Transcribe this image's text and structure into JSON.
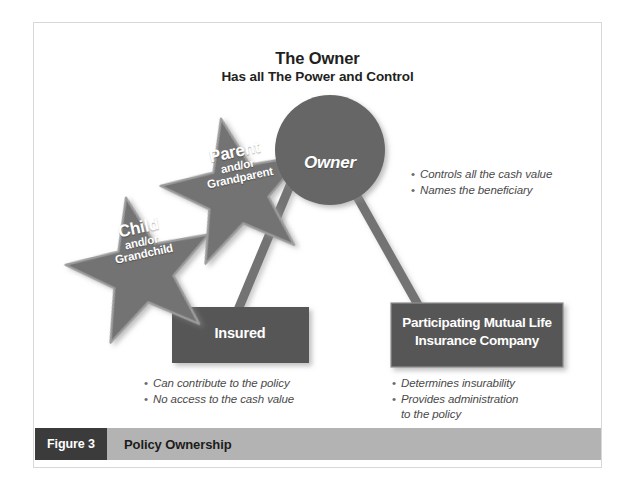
{
  "figure": {
    "title_line_1": "The Owner",
    "title_line_2": "Has all The Power and Control",
    "caption_number": "Figure 3",
    "caption_title": "Policy Ownership"
  },
  "nodes": {
    "owner": {
      "shape": "circle",
      "label": "Owner",
      "color": "#666666"
    },
    "parent_star": {
      "shape": "star",
      "line_1": "Parent",
      "line_2": "and/or",
      "line_3": "Grandparent",
      "color": "#737373"
    },
    "child_star": {
      "shape": "star",
      "line_1": "Child",
      "line_2": "and/or",
      "line_3": "Grandchild",
      "color": "#737373"
    },
    "insured_box": {
      "shape": "rectangle",
      "label": "Insured",
      "color": "#575757"
    },
    "company_box": {
      "shape": "rectangle",
      "line_1": "Participating Mutual Life",
      "line_2": "Insurance Company",
      "color": "#575757"
    }
  },
  "bullets": {
    "owner": [
      "Controls all the cash value",
      "Names the beneficiary"
    ],
    "insured": [
      "Can contribute to the policy",
      "No access to the cash value"
    ],
    "company": [
      "Determines insurability",
      "Provides administration",
      "to the policy"
    ]
  },
  "colors": {
    "node_dark": "#575757",
    "node_mid": "#666666",
    "star": "#737373",
    "connector": "#737373",
    "caption_bar": "#b3b3b3",
    "caption_number_box": "#3b3b3b",
    "frame_border": "#d8d8d8",
    "text_dark": "#231f20",
    "bullet_text": "#4a4a4a"
  }
}
